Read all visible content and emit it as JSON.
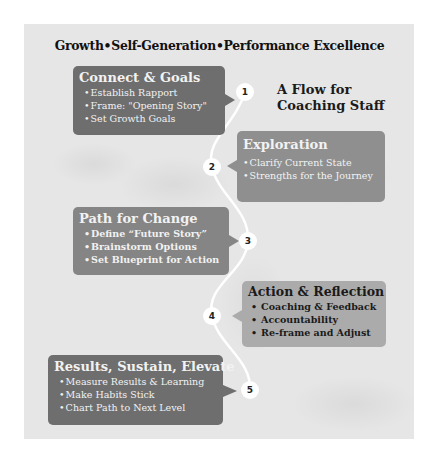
{
  "title": "Growth•Self-Generation•Performance Excellence",
  "subtitle": {
    "line1": "A Flow for",
    "line2": "Coaching Staff"
  },
  "colors": {
    "dark_box": "#6e6e6e",
    "mid_box": "#8f8f8f",
    "light_box": "#ababab",
    "panel": "#e6e6e6",
    "path": "#ffffff"
  },
  "steps": [
    {
      "number": "1",
      "heading": "Connect & Goals",
      "items": [
        "Establish Rapport",
        "Frame: \"Opening Story\"",
        "Set Growth Goals"
      ]
    },
    {
      "number": "2",
      "heading": "Exploration",
      "items": [
        "Clarify  Current State",
        "Strengths for the Journey"
      ]
    },
    {
      "number": "3",
      "heading": "Path for Change",
      "items": [
        "Define “Future Story”",
        "Brainstorm Options",
        "Set Blueprint for Action"
      ]
    },
    {
      "number": "4",
      "heading": "Action & Reflection",
      "items": [
        "Coaching & Feedback",
        "Accountability",
        "Re-frame and Adjust"
      ]
    },
    {
      "number": "5",
      "heading": "Results, Sustain, Elevate",
      "items": [
        "Measure Results & Learning",
        "Make Habits Stick",
        "Chart Path to Next Level"
      ]
    }
  ]
}
